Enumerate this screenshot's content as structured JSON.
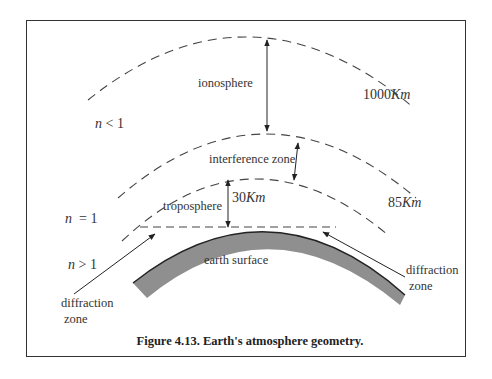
{
  "figure": {
    "caption": "Figure 4.13. Earth's atmosphere geometry.",
    "labels": {
      "ionosphere": "ionosphere",
      "interference_zone": "interference zone",
      "troposphere": "troposphere",
      "earth_surface": "earth surface",
      "diffraction_zone_left_1": "diffraction",
      "diffraction_zone_left_2": "zone",
      "diffraction_zone_right_1": "diffraction",
      "diffraction_zone_right_2": "zone",
      "alt_1000_num": "1000",
      "alt_1000_unit": "Km",
      "alt_85_num": "85",
      "alt_85_unit": "Km",
      "alt_30_num": "30",
      "alt_30_unit": "Km",
      "n_lt_var": "n",
      "n_lt_rel": "< 1",
      "n_eq_var": "n",
      "n_eq_rel": "= 1",
      "n_gt_var": "n",
      "n_gt_rel": "> 1"
    },
    "colors": {
      "line": "#333333",
      "earth_fill": "#8f8f8f",
      "dash": "#444444"
    }
  }
}
